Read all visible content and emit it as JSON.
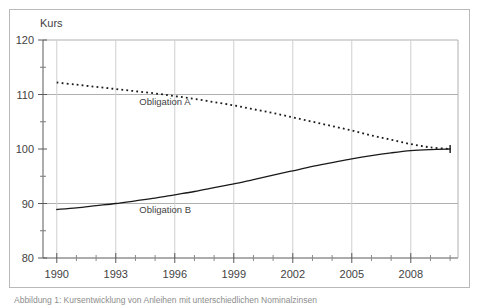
{
  "figure": {
    "caption": "Abbildung 1: Kursentwicklung von Anleihen mit unterschiedlichen Nominalzinsen"
  },
  "chart_data": {
    "type": "line",
    "title": "",
    "xlabel": "",
    "ylabel": "Kurs",
    "xlim": [
      1989.3,
      2010.4
    ],
    "ylim": [
      80,
      120
    ],
    "xticks": [
      1990,
      1993,
      1996,
      1999,
      2002,
      2005,
      2008
    ],
    "xtick_labels": [
      "1990",
      "1993",
      "1996",
      "1999",
      "2002",
      "2005",
      "2008"
    ],
    "x_minor_tick_step": 1,
    "yticks": [
      80,
      90,
      100,
      110,
      120
    ],
    "ytick_labels": [
      "80",
      "90",
      "100",
      "110",
      "120"
    ],
    "y_minor_ticks": [
      85,
      95,
      105,
      115
    ],
    "gridlines_y": [
      90,
      110,
      120
    ],
    "grid": true,
    "grid_color": "#b0b0b0",
    "legend_position": "inline-annotation",
    "series": [
      {
        "name": "Obligation A",
        "style": "dotted",
        "color": "#1a1a1a",
        "label_x": 1994.2,
        "label_y": 108.0,
        "x": [
          1990,
          1991,
          1992,
          1993,
          1994,
          1995,
          1996,
          1997,
          1998,
          1999,
          2000,
          2001,
          2002,
          2003,
          2004,
          2005,
          2006,
          2007,
          2008,
          2009,
          2010
        ],
        "values": [
          112.2,
          111.8,
          111.4,
          111.0,
          110.6,
          110.2,
          109.7,
          109.2,
          108.6,
          108.0,
          107.3,
          106.6,
          105.8,
          105.0,
          104.2,
          103.4,
          102.5,
          101.7,
          100.9,
          100.3,
          100.0
        ]
      },
      {
        "name": "Obligation B",
        "style": "solid",
        "color": "#1a1a1a",
        "label_x": 1994.2,
        "label_y": 88.2,
        "x": [
          1990,
          1991,
          1992,
          1993,
          1994,
          1995,
          1996,
          1997,
          1998,
          1999,
          2000,
          2001,
          2002,
          2003,
          2004,
          2005,
          2006,
          2007,
          2008,
          2009,
          2010
        ],
        "values": [
          88.9,
          89.2,
          89.6,
          90.0,
          90.5,
          91.0,
          91.6,
          92.2,
          92.9,
          93.6,
          94.4,
          95.2,
          96.0,
          96.8,
          97.5,
          98.2,
          98.8,
          99.3,
          99.7,
          99.9,
          100.0
        ]
      }
    ],
    "annotations": [
      {
        "name": "maturity-convergence",
        "x": 2010,
        "y": 100,
        "text": ""
      }
    ]
  }
}
